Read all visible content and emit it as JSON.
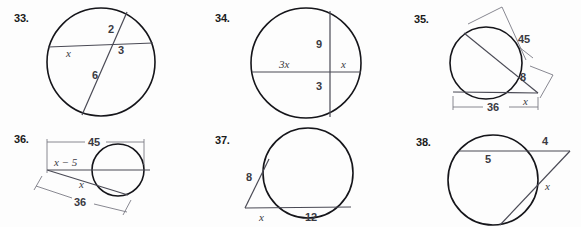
{
  "page": {
    "background": "#fdfdfd",
    "ink": "#15151a",
    "label_color": "#3a3a42",
    "dimension_color": "#7a7a85"
  },
  "problems": [
    {
      "number": "33.",
      "type": "two-intersecting-chords",
      "labels": [
        {
          "text": "2",
          "style": "number"
        },
        {
          "text": "3",
          "style": "number"
        },
        {
          "text": "x",
          "style": "variable"
        },
        {
          "text": "6",
          "style": "number"
        }
      ]
    },
    {
      "number": "34.",
      "type": "two-intersecting-chords",
      "labels": [
        {
          "text": "9",
          "style": "number"
        },
        {
          "text": "3x",
          "style": "variable"
        },
        {
          "text": "x",
          "style": "variable"
        },
        {
          "text": "3",
          "style": "number"
        }
      ]
    },
    {
      "number": "35.",
      "type": "two-secants-external-point",
      "labels": [
        {
          "text": "45",
          "style": "number"
        },
        {
          "text": "8",
          "style": "number"
        },
        {
          "text": "x",
          "style": "variable"
        },
        {
          "text": "36",
          "style": "number"
        }
      ]
    },
    {
      "number": "36.",
      "type": "two-secants-external-point",
      "labels": [
        {
          "text": "45",
          "style": "number"
        },
        {
          "text": "x − 5",
          "style": "variable"
        },
        {
          "text": "x",
          "style": "variable"
        },
        {
          "text": "36",
          "style": "number"
        }
      ]
    },
    {
      "number": "37.",
      "type": "tangent-and-secant",
      "labels": [
        {
          "text": "8",
          "style": "number"
        },
        {
          "text": "x",
          "style": "variable"
        },
        {
          "text": "12",
          "style": "number"
        }
      ]
    },
    {
      "number": "38.",
      "type": "tangent-and-secant",
      "labels": [
        {
          "text": "5",
          "style": "number"
        },
        {
          "text": "4",
          "style": "number"
        },
        {
          "text": "x",
          "style": "variable"
        }
      ]
    }
  ]
}
